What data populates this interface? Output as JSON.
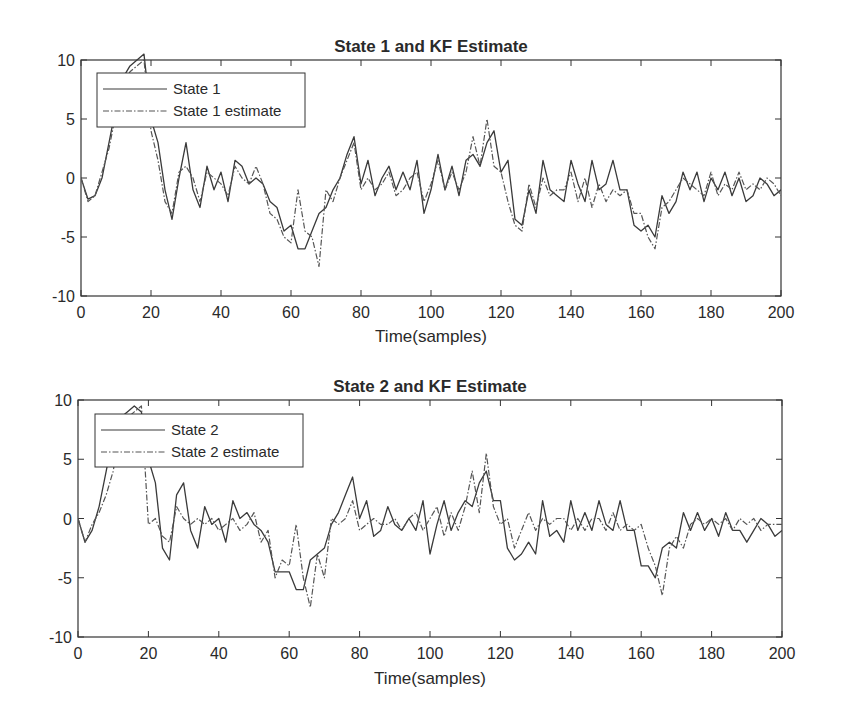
{
  "chart_data": [
    {
      "type": "line",
      "title": "State 1 and KF Estimate",
      "xlabel": "Time(samples)",
      "ylabel": "",
      "xlim": [
        0,
        200
      ],
      "ylim": [
        -10,
        10
      ],
      "xticks": [
        0,
        20,
        40,
        60,
        80,
        100,
        120,
        140,
        160,
        180,
        200
      ],
      "yticks": [
        -10,
        -5,
        0,
        5,
        10
      ],
      "grid": false,
      "legend_position": "upper-left",
      "series": [
        {
          "name": "State 1",
          "style": "solid",
          "x": [
            0,
            2,
            4,
            6,
            8,
            10,
            12,
            14,
            16,
            18,
            20,
            22,
            24,
            26,
            28,
            30,
            32,
            34,
            36,
            38,
            40,
            42,
            44,
            46,
            48,
            50,
            52,
            54,
            56,
            58,
            60,
            62,
            64,
            66,
            68,
            70,
            72,
            74,
            76,
            78,
            80,
            82,
            84,
            86,
            88,
            90,
            92,
            94,
            96,
            98,
            100,
            102,
            104,
            106,
            108,
            110,
            112,
            114,
            116,
            118,
            120,
            122,
            124,
            126,
            128,
            130,
            132,
            134,
            136,
            138,
            140,
            142,
            144,
            146,
            148,
            150,
            152,
            154,
            156,
            158,
            160,
            162,
            164,
            166,
            168,
            170,
            172,
            174,
            176,
            178,
            180,
            182,
            184,
            186,
            188,
            190,
            192,
            194,
            196,
            198,
            200
          ],
          "values": [
            0,
            -1.8,
            -1.5,
            0,
            3,
            6,
            8.5,
            9.5,
            10,
            10.5,
            5,
            3,
            -1,
            -3.5,
            0,
            3,
            -1,
            -2.5,
            1,
            -1,
            0.5,
            -2,
            1.5,
            1,
            -0.5,
            0,
            -0.5,
            -2,
            -2.5,
            -4.5,
            -4,
            -6,
            -6,
            -4.5,
            -3,
            -2.5,
            -1,
            0,
            2,
            3.5,
            -0.5,
            1.5,
            -1.5,
            0,
            1,
            -1,
            0.5,
            -1,
            1.5,
            -3,
            -1,
            2,
            -1,
            1,
            -1.5,
            1.5,
            2,
            1,
            3,
            4,
            0.5,
            1.5,
            -3.5,
            -4,
            -1,
            -3,
            1.5,
            -1,
            -1.5,
            -2,
            1.5,
            -0.5,
            -2,
            1.5,
            -1,
            -0.5,
            1.5,
            -1,
            -1,
            -4,
            -4.5,
            -4,
            -5,
            -1.5,
            -3,
            -2,
            0.5,
            -1,
            0.5,
            -2,
            0,
            -1,
            0.5,
            -1.5,
            0,
            -2,
            -1.5,
            0,
            -0.5,
            -1.5,
            -1
          ]
        },
        {
          "name": "State 1 estimate",
          "style": "dash-dot",
          "x": [
            0,
            2,
            4,
            6,
            8,
            10,
            12,
            14,
            16,
            18,
            20,
            22,
            24,
            26,
            28,
            30,
            32,
            34,
            36,
            38,
            40,
            42,
            44,
            46,
            48,
            50,
            52,
            54,
            56,
            58,
            60,
            62,
            64,
            66,
            68,
            70,
            72,
            74,
            76,
            78,
            80,
            82,
            84,
            86,
            88,
            90,
            92,
            94,
            96,
            98,
            100,
            102,
            104,
            106,
            108,
            110,
            112,
            114,
            116,
            118,
            120,
            122,
            124,
            126,
            128,
            130,
            132,
            134,
            136,
            138,
            140,
            142,
            144,
            146,
            148,
            150,
            152,
            154,
            156,
            158,
            160,
            162,
            164,
            166,
            168,
            170,
            172,
            174,
            176,
            178,
            180,
            182,
            184,
            186,
            188,
            190,
            192,
            194,
            196,
            198,
            200
          ],
          "values": [
            0,
            -2,
            -1.5,
            0.5,
            2.5,
            5.5,
            8,
            9,
            9.5,
            10,
            4,
            1.5,
            -2,
            -3,
            0.5,
            1,
            0,
            -2,
            0.5,
            0,
            -0.5,
            -1.5,
            1,
            0,
            -0.5,
            1,
            -0.5,
            -3,
            -3.5,
            -5,
            -5.5,
            -1,
            -4.5,
            -5,
            -7.5,
            -1,
            -2,
            0,
            1.5,
            3,
            -1,
            0,
            -1,
            -0.5,
            0.5,
            -1.5,
            -1,
            0,
            0.5,
            -2,
            -0.5,
            1.5,
            -1,
            0.5,
            -1,
            0.5,
            3.5,
            1,
            5,
            1,
            0.5,
            -2,
            -4,
            -4.5,
            -0.5,
            -2.5,
            0,
            -1.5,
            -1,
            -1,
            0.5,
            -2,
            0,
            -2.5,
            -0.5,
            -2,
            -1,
            -1.5,
            -1,
            -3,
            -3,
            -5,
            -6,
            -2.5,
            -2,
            -1,
            0,
            -0.5,
            -1,
            -1.5,
            0.5,
            -1.5,
            -0.5,
            -1,
            0.5,
            -1,
            -0.5,
            -1,
            0,
            -0.5,
            -1.5
          ]
        }
      ]
    },
    {
      "type": "line",
      "title": "State 2 and KF Estimate",
      "xlabel": "Time(samples)",
      "ylabel": "",
      "xlim": [
        0,
        200
      ],
      "ylim": [
        -10,
        10
      ],
      "xticks": [
        0,
        20,
        40,
        60,
        80,
        100,
        120,
        140,
        160,
        180,
        200
      ],
      "yticks": [
        -10,
        -5,
        0,
        5,
        10
      ],
      "grid": false,
      "legend_position": "upper-left",
      "series": [
        {
          "name": "State 2",
          "style": "solid",
          "x": [
            0,
            2,
            4,
            6,
            8,
            10,
            12,
            14,
            16,
            18,
            20,
            22,
            24,
            26,
            28,
            30,
            32,
            34,
            36,
            38,
            40,
            42,
            44,
            46,
            48,
            50,
            52,
            54,
            56,
            58,
            60,
            62,
            64,
            66,
            68,
            70,
            72,
            74,
            76,
            78,
            80,
            82,
            84,
            86,
            88,
            90,
            92,
            94,
            96,
            98,
            100,
            102,
            104,
            106,
            108,
            110,
            112,
            114,
            116,
            118,
            120,
            122,
            124,
            126,
            128,
            130,
            132,
            134,
            136,
            138,
            140,
            142,
            144,
            146,
            148,
            150,
            152,
            154,
            156,
            158,
            160,
            162,
            164,
            166,
            168,
            170,
            172,
            174,
            176,
            178,
            180,
            182,
            184,
            186,
            188,
            190,
            192,
            194,
            196,
            198,
            200
          ],
          "values": [
            0,
            -2,
            -1,
            1,
            4,
            7,
            8.5,
            9,
            9.5,
            9,
            5,
            3,
            -2.5,
            -3.5,
            2,
            3,
            -1,
            -2.5,
            1,
            -0.5,
            0,
            -2,
            1.5,
            0,
            0.5,
            -0.5,
            -1,
            -2,
            -4.5,
            -4.5,
            -4.5,
            -6,
            -6,
            -3.5,
            -3,
            -2.5,
            -0.5,
            0.5,
            2,
            3.5,
            0,
            1.5,
            -1.5,
            -1,
            1,
            -0.5,
            -1,
            0,
            -1,
            1.5,
            -3,
            -0.5,
            1.5,
            -1,
            0.5,
            1.5,
            1,
            3,
            4,
            1.5,
            1.5,
            -2.5,
            -3.5,
            -3,
            -2,
            -3,
            1.5,
            -1.5,
            -1,
            -2,
            1.5,
            -1,
            0.5,
            -1,
            1.5,
            -0.5,
            -1,
            1.5,
            -1,
            -1,
            -4,
            -4,
            -5,
            -2.5,
            -2,
            -2.5,
            0.5,
            -1,
            0.5,
            -1,
            0,
            -1.5,
            0.5,
            -1,
            -1,
            -2,
            -1,
            0,
            -0.5,
            -1.5,
            -1
          ]
        },
        {
          "name": "State 2 estimate",
          "style": "dash-dot",
          "x": [
            0,
            2,
            4,
            6,
            8,
            10,
            12,
            14,
            16,
            18,
            20,
            22,
            24,
            26,
            28,
            30,
            32,
            34,
            36,
            38,
            40,
            42,
            44,
            46,
            48,
            50,
            52,
            54,
            56,
            58,
            60,
            62,
            64,
            66,
            68,
            70,
            72,
            74,
            76,
            78,
            80,
            82,
            84,
            86,
            88,
            90,
            92,
            94,
            96,
            98,
            100,
            102,
            104,
            106,
            108,
            110,
            112,
            114,
            116,
            118,
            120,
            122,
            124,
            126,
            128,
            130,
            132,
            134,
            136,
            138,
            140,
            142,
            144,
            146,
            148,
            150,
            152,
            154,
            156,
            158,
            160,
            162,
            164,
            166,
            168,
            170,
            172,
            174,
            176,
            178,
            180,
            182,
            184,
            186,
            188,
            190,
            192,
            194,
            196,
            198,
            200
          ],
          "values": [
            0,
            -2,
            -0.5,
            0.5,
            2,
            4,
            7.5,
            8.5,
            9,
            9.5,
            -0.5,
            0,
            -1.5,
            -2,
            1,
            0,
            -0.5,
            0,
            -0.5,
            0,
            -1,
            -0.5,
            0,
            -1,
            -0.5,
            0.5,
            -2,
            -1,
            -5,
            -3.5,
            -4,
            -0.5,
            -5,
            -7.5,
            -3,
            -5,
            0,
            -0.5,
            0,
            1.5,
            -1,
            -0.5,
            0,
            -0.5,
            -0.5,
            0,
            -1,
            0,
            0.5,
            -1,
            0,
            1,
            -1.5,
            0.5,
            -1,
            1,
            4,
            0.5,
            5.5,
            1,
            -0.5,
            0,
            -2.5,
            -1,
            0.5,
            -1,
            0,
            -0.5,
            0,
            0,
            -1,
            0,
            -1,
            0,
            0,
            -1,
            0.5,
            -1,
            -0.5,
            -1,
            -0.5,
            -2.5,
            -4,
            -6.5,
            -2.5,
            -1.5,
            -2.5,
            -0.5,
            0,
            -0.5,
            0,
            -0.5,
            0,
            -1,
            0,
            -0.5,
            0,
            -1,
            -0.5,
            -0.5,
            -0.5
          ]
        }
      ]
    }
  ]
}
